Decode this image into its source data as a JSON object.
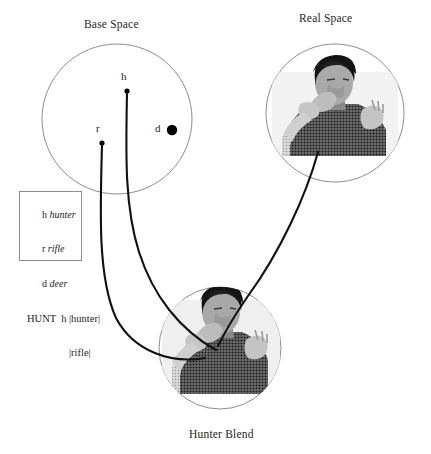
{
  "figure": {
    "caption_bottom": "Hunter Blend"
  },
  "spaces": [
    {
      "id": "base",
      "title": "Base Space"
    },
    {
      "id": "real",
      "title": "Real Space"
    },
    {
      "id": "blend",
      "title": "Hunter Blend"
    }
  ],
  "base_space": {
    "title": "Base Space",
    "nodes": [
      {
        "id": "h",
        "label": "h",
        "kind": "small-dot"
      },
      {
        "id": "r",
        "label": "r",
        "kind": "small-dot"
      },
      {
        "id": "d",
        "label": "d",
        "kind": "large-dot"
      }
    ]
  },
  "real_space": {
    "title": "Real Space",
    "image_alt": "signer-photo-real-space"
  },
  "blend_space": {
    "title": "Hunter Blend",
    "image_alt": "signer-photo-blend"
  },
  "legend": {
    "entries": [
      {
        "symbol": "h",
        "gloss": "hunter"
      },
      {
        "symbol": "r",
        "gloss": "rifle"
      },
      {
        "symbol": "d",
        "gloss": "deer"
      }
    ],
    "frame": "HUNT  h"
  },
  "projection_labels": [
    {
      "id": "hunter-magnitude",
      "text": "|hunter|"
    },
    {
      "id": "rifle-magnitude",
      "text": "|rifle|"
    }
  ],
  "colors": {
    "background": "#ffffff",
    "circle_stroke": "#8d8d8d",
    "mapping_line": "#111111",
    "text": "#1e1e1e",
    "legend_border": "#8d8d8d",
    "node_dot": "#000000"
  }
}
